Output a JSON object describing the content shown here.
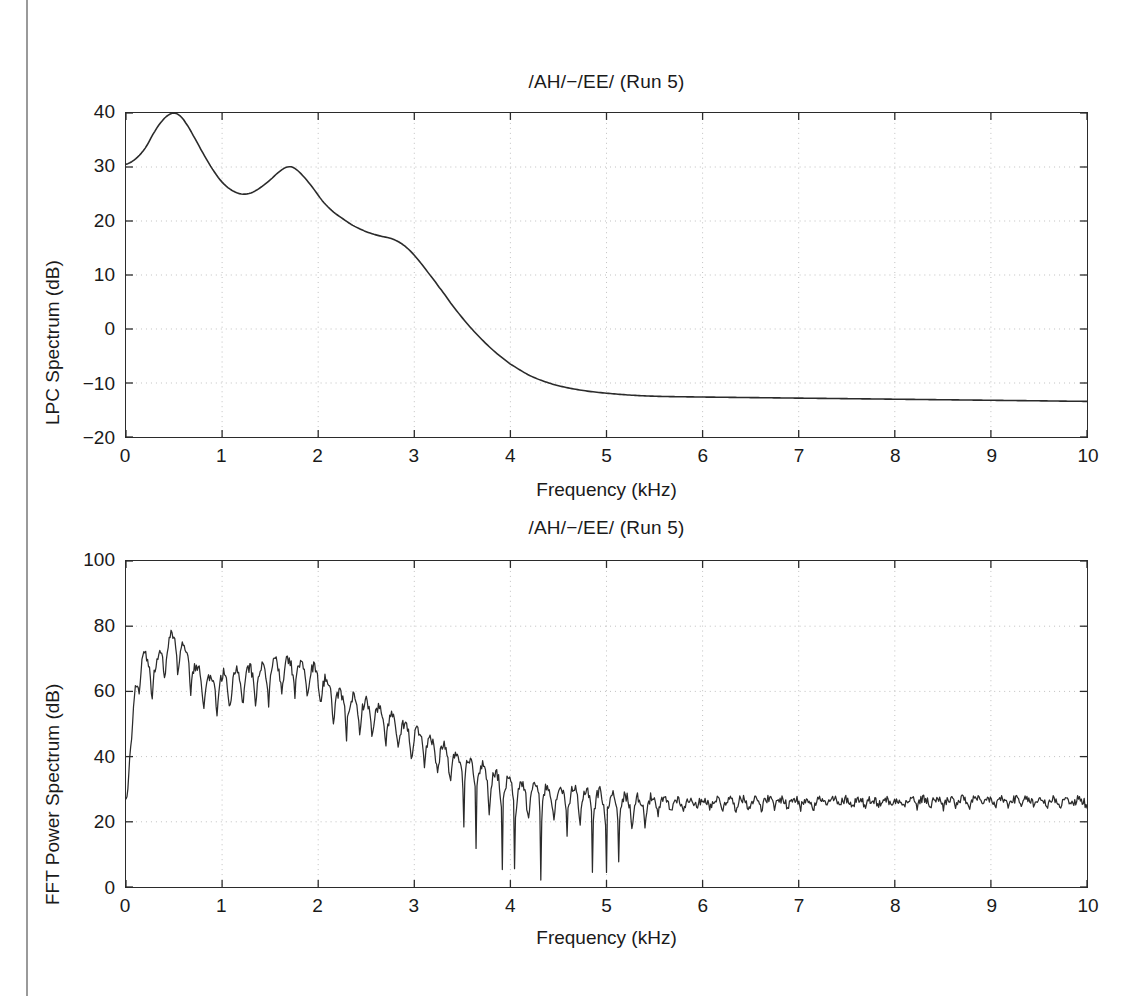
{
  "page": {
    "background_color": "#ffffff",
    "line_color": "#2b2b2b",
    "grid_color": "#bfbfbf",
    "text_color": "#1a1a1a"
  },
  "chart_data": [
    {
      "id": "lpc",
      "type": "line",
      "title": "/AH/−/EE/ (Run 5)",
      "xlabel": "Frequency (kHz)",
      "ylabel": "LPC Spectrum (dB)",
      "xlim": [
        0,
        10
      ],
      "ylim": [
        -20,
        40
      ],
      "xticks": [
        "0",
        "1",
        "2",
        "3",
        "4",
        "5",
        "6",
        "7",
        "8",
        "9",
        "10"
      ],
      "yticks": [
        "-20",
        "-10",
        "0",
        "10",
        "20",
        "30",
        "40"
      ],
      "grid": true,
      "legend": "none",
      "series": [
        {
          "name": "LPC envelope",
          "x": [
            0.0,
            0.1,
            0.2,
            0.3,
            0.38,
            0.44,
            0.5,
            0.56,
            0.62,
            0.7,
            0.8,
            0.9,
            1.0,
            1.1,
            1.2,
            1.3,
            1.4,
            1.5,
            1.6,
            1.68,
            1.75,
            1.85,
            1.95,
            2.05,
            2.15,
            2.25,
            2.35,
            2.45,
            2.55,
            2.65,
            2.75,
            2.85,
            2.95,
            3.05,
            3.15,
            3.25,
            3.4,
            3.55,
            3.7,
            3.85,
            4.0,
            4.2,
            4.4,
            4.6,
            4.8,
            5.0,
            5.3,
            5.6,
            6.0,
            6.5,
            7.0,
            7.5,
            8.0,
            8.5,
            9.0,
            9.5,
            10.0
          ],
          "y": [
            30.5,
            31.5,
            33.5,
            36.6,
            38.6,
            39.6,
            40.0,
            39.5,
            38.2,
            35.8,
            32.6,
            29.6,
            27.2,
            25.7,
            25.0,
            25.2,
            26.2,
            27.6,
            29.2,
            30.0,
            29.8,
            28.2,
            26.0,
            23.6,
            21.8,
            20.5,
            19.3,
            18.4,
            17.7,
            17.2,
            16.8,
            16.0,
            14.6,
            12.6,
            10.3,
            7.9,
            4.3,
            1.0,
            -1.9,
            -4.4,
            -6.5,
            -8.6,
            -10.0,
            -10.9,
            -11.5,
            -11.9,
            -12.3,
            -12.5,
            -12.6,
            -12.7,
            -12.8,
            -12.9,
            -13.0,
            -13.1,
            -13.2,
            -13.3,
            -13.4
          ]
        }
      ],
      "annotations": {
        "formant_1_khz": 0.5,
        "formant_1_db": 40,
        "formant_2_khz": 1.7,
        "formant_2_db": 30,
        "value_at_0_khz_db": 30.5,
        "value_at_10_khz_db": -13.4
      }
    },
    {
      "id": "fft",
      "type": "line",
      "title": "/AH/−/EE/ (Run 5)",
      "xlabel": "Frequency (kHz)",
      "ylabel": "FFT Power Spectrum (dB)",
      "xlim": [
        0,
        10
      ],
      "ylim": [
        0,
        100
      ],
      "xticks": [
        "0",
        "1",
        "2",
        "3",
        "4",
        "5",
        "6",
        "7",
        "8",
        "9",
        "10"
      ],
      "yticks": [
        "0",
        "20",
        "40",
        "60",
        "80",
        "100"
      ],
      "grid": true,
      "legend": "none",
      "description": "Harmonic line spectrum with F0 ripple, peak 85 dB near 0.5 kHz, decaying to a 26 dB noise floor above 5.5 kHz",
      "annotations": {
        "value_at_0_khz_db": 27,
        "max_db": 85,
        "max_at_khz": 0.5,
        "noise_floor_db": 26,
        "deepest_notch_db": 10,
        "deepest_notch_khz": 5.0
      },
      "series": [
        {
          "name": "FFT power spectrum",
          "envelope_x": [
            0.0,
            0.12,
            0.3,
            0.5,
            0.8,
            1.1,
            1.4,
            1.7,
            2.0,
            2.2,
            2.5,
            2.8,
            3.1,
            3.4,
            3.7,
            4.0,
            4.4,
            4.8,
            5.2,
            5.6,
            6.0,
            7.0,
            8.0,
            9.0,
            10.0
          ],
          "envelope_y": [
            27.0,
            68.0,
            70.0,
            78.0,
            66.0,
            66.0,
            68.0,
            70.0,
            67.0,
            60.0,
            57.0,
            52.0,
            47.0,
            42.0,
            38.0,
            33.0,
            31.0,
            30.0,
            28.0,
            27.0,
            27.0,
            27.0,
            27.0,
            27.0,
            27.0
          ],
          "ripple_depth_db": [
            0.0,
            12.0,
            14.0,
            16.0,
            14.0,
            16.0,
            14.0,
            14.0,
            14.0,
            14.0,
            13.0,
            13.0,
            13.0,
            14.0,
            15.0,
            16.0,
            14.0,
            14.0,
            12.0,
            6.0,
            4.0,
            3.5,
            3.0,
            3.0,
            3.0
          ],
          "f0_khz": 0.135
        }
      ]
    }
  ]
}
